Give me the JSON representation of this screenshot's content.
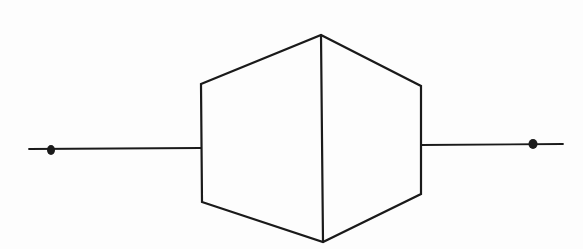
{
  "diagram": {
    "type": "symbol",
    "colors": {
      "background": "#fdfdfd",
      "stroke": "#1a1a1a"
    },
    "shape": {
      "outline": [
        [
          201,
          84
        ],
        [
          321,
          35
        ],
        [
          421,
          86
        ],
        [
          421,
          194
        ],
        [
          323,
          242
        ],
        [
          202,
          202
        ]
      ],
      "center_edge": [
        [
          321,
          35
        ],
        [
          323,
          242
        ]
      ]
    },
    "input_line": {
      "x1": 29,
      "y1": 149,
      "x2": 201,
      "y2": 148,
      "dot": [
        51,
        150
      ]
    },
    "output_line": {
      "x1": 421,
      "y1": 145,
      "x2": 563,
      "y2": 144,
      "dot": [
        533,
        144
      ]
    }
  }
}
